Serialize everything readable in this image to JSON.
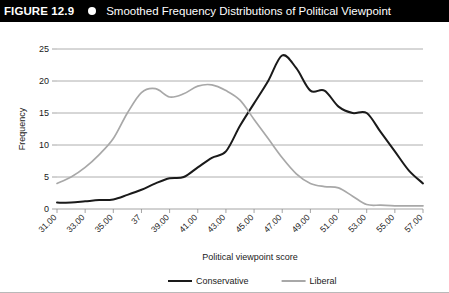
{
  "header": {
    "figure_number": "FIGURE 12.9",
    "bullet_icon": "filled-circle-icon",
    "title": "Smoothed Frequency Distributions of Political Viewpoint"
  },
  "chart_data": {
    "type": "line",
    "title": "Smoothed Frequency Distributions of Political Viewpoint",
    "xlabel": "Political viewpoint score",
    "ylabel": "Frequency",
    "xlim": [
      31,
      57
    ],
    "ylim": [
      0,
      25
    ],
    "yticks": [
      0,
      5,
      10,
      15,
      20,
      25
    ],
    "ytick_labels": [
      "0",
      "5",
      "10",
      "15",
      "20",
      "25"
    ],
    "grid": true,
    "grid_axis": "y",
    "legend_position": "bottom",
    "x": [
      31,
      32,
      33,
      34,
      35,
      36,
      37,
      38,
      39,
      40,
      41,
      42,
      43,
      44,
      45,
      46,
      47,
      48,
      49,
      50,
      51,
      52,
      53,
      54,
      55,
      56,
      57
    ],
    "xtick_values": [
      31,
      33,
      35,
      37,
      39,
      41,
      43,
      45,
      47,
      49,
      51,
      53,
      55,
      57
    ],
    "xtick_labels": [
      "31.00",
      "33.00",
      "35.00",
      "37",
      "39.00",
      "41.00",
      "43.00",
      "45.00",
      "47.00",
      "49.00",
      "51.00",
      "53.00",
      "55.00",
      "57.00"
    ],
    "series": [
      {
        "name": "Conservative",
        "color": "#1a1a1a",
        "values": [
          1.0,
          1.0,
          1.2,
          1.4,
          1.5,
          2.2,
          3.0,
          4.0,
          4.8,
          5.0,
          6.5,
          8.0,
          9.0,
          13.0,
          16.5,
          20.0,
          24.0,
          22.0,
          18.5,
          18.5,
          16.0,
          15.0,
          15.0,
          12.0,
          9.0,
          6.0,
          4.0
        ]
      },
      {
        "name": "Liberal",
        "color": "#a8a8a8",
        "values": [
          4.0,
          5.0,
          6.5,
          8.5,
          11.0,
          15.0,
          18.2,
          18.8,
          17.5,
          18.0,
          19.2,
          19.4,
          18.5,
          17.0,
          14.0,
          11.0,
          8.0,
          5.5,
          4.0,
          3.5,
          3.3,
          2.0,
          0.7,
          0.6,
          0.5,
          0.5,
          0.5
        ]
      }
    ],
    "legend": [
      {
        "label": "Conservative",
        "color": "#1a1a1a"
      },
      {
        "label": "Liberal",
        "color": "#a8a8a8"
      }
    ]
  }
}
